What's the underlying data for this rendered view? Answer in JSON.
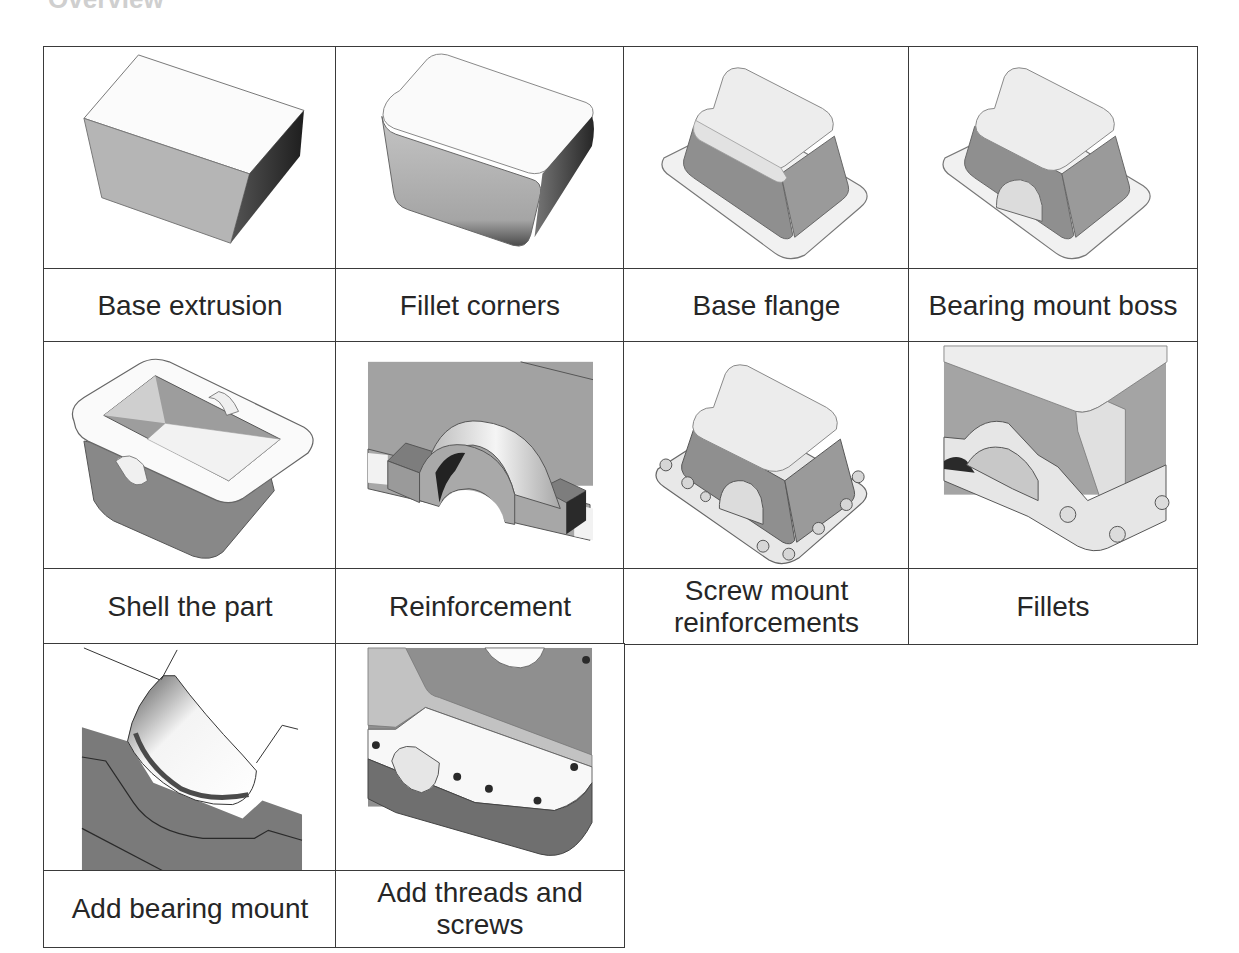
{
  "heading": "Overview",
  "table": {
    "rows": [
      {
        "steps": [
          {
            "icon": "base-extrusion-model",
            "label": "Base extrusion"
          },
          {
            "icon": "fillet-corners-model",
            "label": "Fillet corners"
          },
          {
            "icon": "base-flange-model",
            "label": "Base flange"
          },
          {
            "icon": "bearing-mount-boss-model",
            "label": "Bearing mount boss"
          }
        ]
      },
      {
        "steps": [
          {
            "icon": "shell-part-model",
            "label": "Shell the part"
          },
          {
            "icon": "reinforcement-model",
            "label": "Reinforcement"
          },
          {
            "icon": "screw-mount-reinforcements-model",
            "label": "Screw mount reinforcements"
          },
          {
            "icon": "fillets-model",
            "label": "Fillets"
          }
        ]
      },
      {
        "steps": [
          {
            "icon": "bearing-mount-model",
            "label": "Add bearing mount"
          },
          {
            "icon": "threads-screws-model",
            "label": "Add threads and screws"
          }
        ]
      }
    ]
  },
  "colors": {
    "border": "#3a3a3a",
    "text": "#262626",
    "face_light": "#f4f4f4",
    "face_mid": "#a9a9a9",
    "face_dark": "#3c3c3c"
  }
}
